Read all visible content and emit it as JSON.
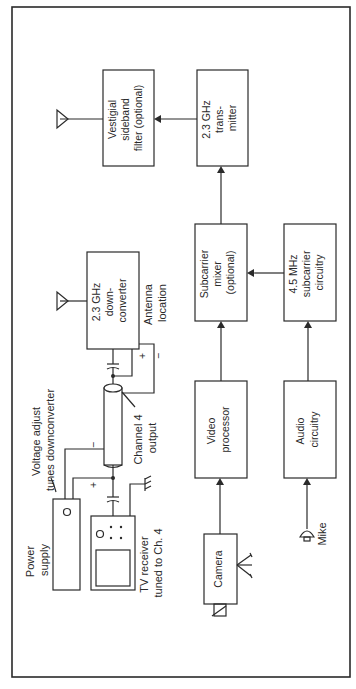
{
  "diagram": {
    "orientation": "rotated -90deg (reads bottom-to-top)",
    "colors": {
      "ink": "#2a2a2a",
      "background": "#ffffff"
    },
    "blocks": {
      "vestigial": [
        "Vestigial",
        "sideband",
        "filter  (optional)"
      ],
      "transmitter": [
        "2.3 GHz",
        "trans-",
        "mitter"
      ],
      "downconverter": [
        "2.3 GHz",
        "down-",
        "converter"
      ],
      "mixer": [
        "Subcarrier",
        "mixer",
        "(optional)"
      ],
      "subcarrier": [
        "4.5 MHz",
        "subcarrier",
        "circuitry"
      ],
      "video": [
        "Video",
        "processor"
      ],
      "audio": [
        "Audio",
        "circuitry"
      ],
      "camera": [
        "Camera"
      ]
    },
    "labels": {
      "antenna_location": [
        "Antenna",
        "location"
      ],
      "voltage_adjust": [
        "Voltage adjust",
        "tunes downconverter"
      ],
      "channel4": [
        "Channel 4",
        "output"
      ],
      "power_supply": [
        "Power",
        "supply"
      ],
      "tv_receiver": [
        "TV receiver",
        "tuned to Ch. 4"
      ],
      "mike": [
        "Mike"
      ],
      "plus": "+",
      "minus": "−"
    }
  }
}
